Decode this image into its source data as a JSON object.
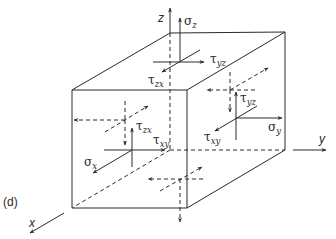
{
  "figure": {
    "panel_label": "(d)"
  },
  "axes": {
    "x": "x",
    "y": "y",
    "z": "z"
  },
  "stresses": {
    "sigma_z": {
      "symbol": "σ",
      "sub": "z"
    },
    "tau_yz_top": {
      "symbol": "τ",
      "sub": "yz"
    },
    "tau_zx_top": {
      "symbol": "τ",
      "sub": "zx"
    },
    "tau_yz_right": {
      "symbol": "τ",
      "sub": "yz"
    },
    "sigma_y": {
      "symbol": "σ",
      "sub": "y"
    },
    "tau_xy_right": {
      "symbol": "τ",
      "sub": "xy"
    },
    "tau_zx_front": {
      "symbol": "τ",
      "sub": "zx"
    },
    "tau_xy_front": {
      "symbol": "τ",
      "sub": "xy"
    },
    "sigma_x": {
      "symbol": "σ",
      "sub": "x"
    }
  },
  "colors": {
    "line": "#2a2a2a",
    "background": "#ffffff"
  }
}
